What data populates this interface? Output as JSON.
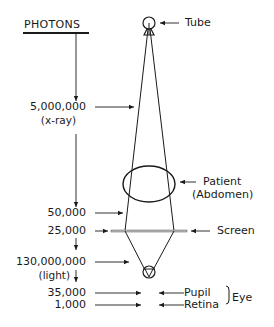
{
  "diagram": {
    "title": "PHOTONS",
    "photon_counts": [
      {
        "value": "5,000,000",
        "note": "(x-ray)",
        "stage": "tube-output"
      },
      {
        "value": "50,000",
        "note": "",
        "stage": "after-patient"
      },
      {
        "value": "25,000",
        "note": "",
        "stage": "screen"
      },
      {
        "value": "130,000,000",
        "note": "(light)",
        "stage": "screen-light"
      },
      {
        "value": "35,000",
        "note": "",
        "stage": "pupil"
      },
      {
        "value": "1,000",
        "note": "",
        "stage": "retina"
      }
    ],
    "components": {
      "tube": "Tube",
      "patient": "Patient",
      "patient_note": "(Abdomen)",
      "screen": "Screen",
      "pupil": "Pupil",
      "retina": "Retina",
      "eye_group": "Eye"
    },
    "colors": {
      "ink": "#1a1a1a",
      "background": "#ffffff",
      "screen_fill": "#bfbfbf"
    }
  }
}
